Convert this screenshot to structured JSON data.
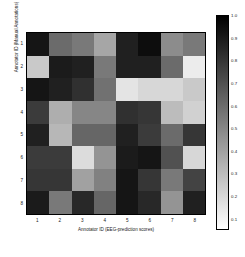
{
  "chart_data": {
    "type": "heatmap",
    "title": "",
    "xlabel": "Annotator ID (EEG-prediction scores)",
    "ylabel": "Annotator ID (Manual Annotations)",
    "xticklabels": [
      "1",
      "2",
      "3",
      "4",
      "5",
      "6",
      "7",
      "8"
    ],
    "yticklabels": [
      "1",
      "2",
      "3",
      "4",
      "5",
      "6",
      "7",
      "8"
    ],
    "x_categories": [
      "1",
      "2",
      "3",
      "4",
      "5",
      "6",
      "7",
      "8"
    ],
    "y_categories": [
      "1",
      "2",
      "3",
      "4",
      "5",
      "6",
      "7",
      "8"
    ],
    "colormap": "gray_reversed",
    "zlim": [
      0.05,
      1.0
    ],
    "grid": false,
    "colorbar": {
      "position": "right",
      "orientation": "vertical",
      "ticks": [
        1.0,
        0.9,
        0.8,
        0.7,
        0.6,
        0.5,
        0.4,
        0.3,
        0.2,
        0.1
      ],
      "ticklabels": [
        "1.0",
        "0.9",
        "0.8",
        "0.7",
        "0.6",
        "0.5",
        "0.4",
        "0.3",
        "0.2",
        "0.1"
      ],
      "vmin": 0.05,
      "vmax": 1.0,
      "high_is_dark": true
    },
    "values": [
      [
        0.92,
        0.6,
        0.55,
        0.38,
        0.88,
        0.95,
        0.48,
        0.55
      ],
      [
        0.25,
        0.9,
        0.88,
        0.55,
        0.88,
        0.88,
        0.6,
        0.12
      ],
      [
        0.92,
        0.88,
        0.82,
        0.58,
        0.15,
        0.2,
        0.2,
        0.25
      ],
      [
        0.78,
        0.35,
        0.5,
        0.5,
        0.82,
        0.8,
        0.3,
        0.22
      ],
      [
        0.88,
        0.32,
        0.62,
        0.62,
        0.88,
        0.78,
        0.6,
        0.8
      ],
      [
        0.78,
        0.78,
        0.18,
        0.45,
        0.9,
        0.92,
        0.7,
        0.2
      ],
      [
        0.8,
        0.8,
        0.4,
        0.52,
        0.92,
        0.8,
        0.55,
        0.75
      ],
      [
        0.9,
        0.55,
        0.85,
        0.62,
        0.92,
        0.85,
        0.45,
        0.88
      ]
    ]
  }
}
